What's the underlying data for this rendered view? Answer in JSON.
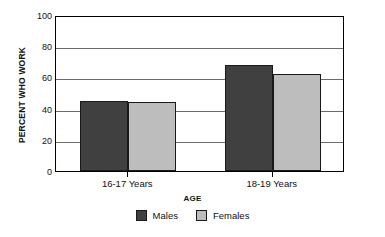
{
  "chart_data": {
    "type": "bar",
    "title": "",
    "xlabel": "AGE",
    "ylabel": "PERCENT WHO WORK",
    "categories": [
      "16-17 Years",
      "18-19 Years"
    ],
    "series": [
      {
        "name": "Males",
        "color": "#404040",
        "values": [
          45,
          68
        ]
      },
      {
        "name": "Females",
        "color": "#bdbdbd",
        "values": [
          44,
          62.5
        ]
      }
    ],
    "ylim": [
      0,
      100
    ],
    "yticks": [
      0,
      20,
      40,
      60,
      80,
      100
    ],
    "ytick_labels": [
      "0",
      "20",
      "40",
      "60",
      "80",
      "100"
    ],
    "grid": true,
    "grid_axis": "y",
    "legend_position": "bottom"
  },
  "axes": {
    "y_title": "PERCENT WHO WORK",
    "x_title": "AGE",
    "y_ticks": [
      {
        "value": 100,
        "label": "100"
      },
      {
        "value": 80,
        "label": "80"
      },
      {
        "value": 60,
        "label": "60"
      },
      {
        "value": 40,
        "label": "40"
      },
      {
        "value": 20,
        "label": "20"
      },
      {
        "value": 0,
        "label": "0"
      }
    ],
    "x_categories": [
      {
        "label": "16-17 Years"
      },
      {
        "label": "18-19 Years"
      }
    ]
  },
  "bars": [
    {
      "group": "16-17 Years",
      "series": "Males",
      "value": 45,
      "color": "#404040"
    },
    {
      "group": "16-17 Years",
      "series": "Females",
      "value": 44,
      "color": "#bdbdbd"
    },
    {
      "group": "18-19 Years",
      "series": "Males",
      "value": 68,
      "color": "#404040"
    },
    {
      "group": "18-19 Years",
      "series": "Females",
      "value": 62.5,
      "color": "#bdbdbd"
    }
  ],
  "legend": {
    "entries": [
      {
        "label": "Males",
        "color": "#404040"
      },
      {
        "label": "Females",
        "color": "#bdbdbd"
      }
    ]
  },
  "style": {
    "axis_color": "#000000",
    "grid_color": "#6b6b6b",
    "bar_border_color": "#1a1a1a",
    "background": "#ffffff"
  }
}
